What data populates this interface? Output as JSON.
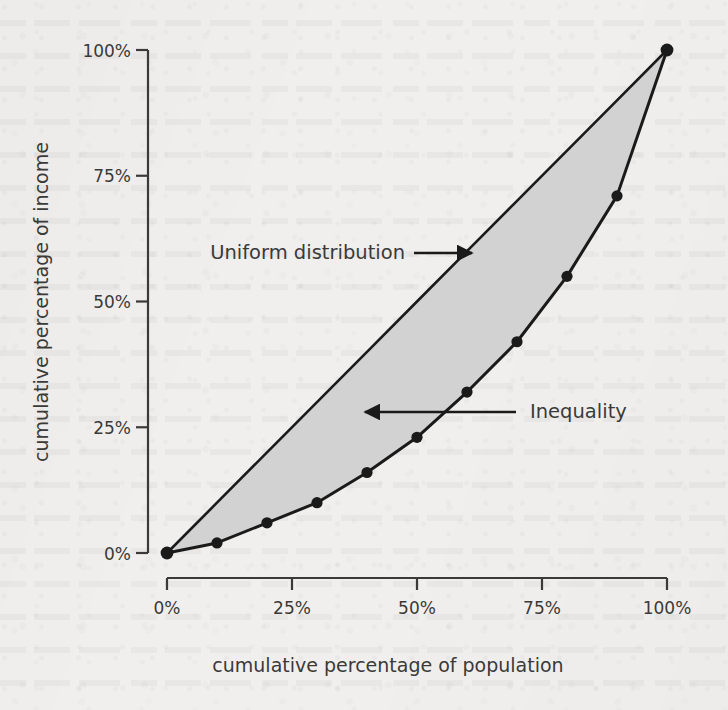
{
  "chart_data": {
    "type": "line",
    "title": "",
    "subtitle": "",
    "xlabel": "cumulative percentage of population",
    "ylabel": "cumulative percentage of income",
    "xlim": [
      0,
      100
    ],
    "ylim": [
      0,
      100
    ],
    "grid": false,
    "legend_position": "none",
    "x_tick_labels": [
      "0%",
      "25%",
      "50%",
      "75%",
      "100%"
    ],
    "x_tick_values": [
      0,
      25,
      50,
      75,
      100
    ],
    "y_tick_labels": [
      "0%",
      "25%",
      "50%",
      "75%",
      "100%"
    ],
    "y_tick_values": [
      0,
      25,
      50,
      75,
      100
    ],
    "x": [
      0,
      10,
      20,
      30,
      40,
      50,
      60,
      70,
      80,
      90,
      100
    ],
    "series": [
      {
        "name": "Lorenz curve",
        "values": [
          0,
          2,
          6,
          10,
          16,
          23,
          32,
          42,
          55,
          71,
          100
        ],
        "marker": "circle",
        "color": "#1a1a1a"
      },
      {
        "name": "Uniform distribution",
        "values": [
          0,
          10,
          20,
          30,
          40,
          50,
          60,
          70,
          80,
          90,
          100
        ],
        "marker": "none",
        "color": "#1a1a1a"
      }
    ],
    "shaded_region": {
      "name": "Inequality",
      "between": [
        "Uniform distribution",
        "Lorenz curve"
      ],
      "fill_color": "#d2d2d2"
    },
    "annotations": [
      {
        "id": "uniform-distribution",
        "text": "Uniform distribution",
        "arrow_direction": "right",
        "points_to": "uniform distribution diagonal line"
      },
      {
        "id": "inequality",
        "text": "Inequality",
        "arrow_direction": "left",
        "points_to": "shaded area between curves"
      }
    ]
  },
  "axes": {
    "x": {
      "title": "cumulative percentage of population",
      "ticks": [
        {
          "label": "0%",
          "value": 0
        },
        {
          "label": "25%",
          "value": 25
        },
        {
          "label": "50%",
          "value": 50
        },
        {
          "label": "75%",
          "value": 75
        },
        {
          "label": "100%",
          "value": 100
        }
      ]
    },
    "y": {
      "title": "cumulative percentage of income",
      "ticks": [
        {
          "label": "0%",
          "value": 0
        },
        {
          "label": "25%",
          "value": 25
        },
        {
          "label": "50%",
          "value": 50
        },
        {
          "label": "75%",
          "value": 75
        },
        {
          "label": "100%",
          "value": 100
        }
      ]
    }
  },
  "annotations": {
    "uniform_label": "Uniform distribution",
    "inequality_label": "Inequality"
  },
  "colors": {
    "background": "#f1efed",
    "ink": "#1a1a1a",
    "text": "#3a3a38",
    "shade": "#d2d2d2"
  }
}
